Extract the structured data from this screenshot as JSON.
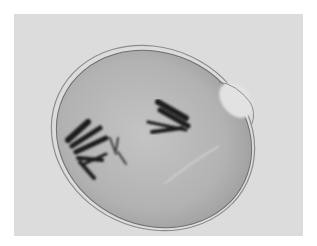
{
  "image": {
    "subject": "micrograph of a cell with two groups of dark chromosomes",
    "style": "grayscale",
    "colors": {
      "border": "#ffffff",
      "background": "#dcdcdc",
      "cytoplasm": "#b4b4b4",
      "membrane": "#8a8a8a",
      "chromosomes": "#1e1e1e"
    }
  }
}
